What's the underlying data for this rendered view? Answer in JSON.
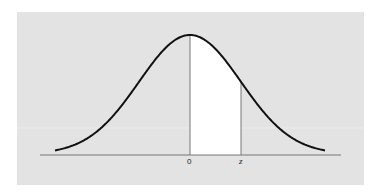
{
  "chart_data": {
    "type": "area",
    "title": "",
    "subtitle": "",
    "xlabel": "",
    "ylabel": "",
    "x_tick_labels": [
      "0",
      "z"
    ],
    "x_range": [
      -3.2,
      3.2
    ],
    "y_range": [
      0,
      0.4
    ],
    "distribution": {
      "name": "standard normal",
      "mean": 0,
      "sd": 1
    },
    "shaded_region": {
      "from": 0,
      "to_label": "z",
      "to_approx": 1.0,
      "fill": "#ffffff"
    },
    "grid": false,
    "legend": null,
    "colors": {
      "background": "#e3e3e3",
      "curve": "#111111",
      "axis": "#777777",
      "shade": "#ffffff"
    }
  },
  "labels": {
    "zero": "0",
    "z": "z"
  }
}
